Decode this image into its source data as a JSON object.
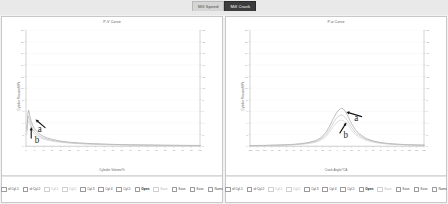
{
  "tabs": [
    {
      "label": "Mill Speed",
      "active": false
    },
    {
      "label": "Mill Crank",
      "active": true
    }
  ],
  "panels": [
    {
      "id": "pv-panel",
      "title": "P-V Curve",
      "xlabel": "Cylinder Volume/%",
      "ylabel": "Cylinder Pressure/MPa",
      "legend": [
        {
          "label": "of Cyl.1",
          "state": "plain",
          "color": "#9a9a9a"
        },
        {
          "label": "of Cyl.2",
          "state": "plain",
          "color": "#9a9a9a"
        },
        {
          "label": "Cyl.1",
          "state": "dim",
          "color": "#c9c9c9"
        },
        {
          "label": "Cyl.2",
          "state": "dim",
          "color": "#c9c9c9"
        },
        {
          "label": "Cyl.3",
          "state": "check",
          "color": "#8c8c8c"
        },
        {
          "label": "Cyl.4",
          "state": "check",
          "color": "#8c8c8c"
        },
        {
          "label": "Cyl.5",
          "state": "check",
          "color": "#8c8c8c"
        },
        {
          "label": "Open",
          "state": "bold",
          "color": "#555555"
        },
        {
          "label": "Save",
          "state": "dim",
          "color": "#c9c9c9"
        },
        {
          "label": "Save",
          "state": "check",
          "color": "#8c8c8c"
        },
        {
          "label": "Save",
          "state": "check",
          "color": "#8c8c8c"
        },
        {
          "label": "Name",
          "state": "check",
          "color": "#8c8c8c"
        }
      ]
    },
    {
      "id": "ptheta-panel",
      "title": "P-α Curve",
      "xlabel": "Crank Angle/°CA",
      "ylabel": "Cylinder Pressure/MPa",
      "legend": [
        {
          "label": "of Cyl.1",
          "state": "plain",
          "color": "#9a9a9a"
        },
        {
          "label": "of Cyl.2",
          "state": "plain",
          "color": "#9a9a9a"
        },
        {
          "label": "Cyl.1",
          "state": "dim",
          "color": "#c9c9c9"
        },
        {
          "label": "Cyl.2",
          "state": "dim",
          "color": "#c9c9c9"
        },
        {
          "label": "Cyl.3",
          "state": "check",
          "color": "#8c8c8c"
        },
        {
          "label": "Cyl.4",
          "state": "check",
          "color": "#8c8c8c"
        },
        {
          "label": "Cyl.5",
          "state": "check",
          "color": "#8c8c8c"
        },
        {
          "label": "Open",
          "state": "bold",
          "color": "#555555"
        },
        {
          "label": "Save",
          "state": "dim",
          "color": "#c9c9c9"
        },
        {
          "label": "Save",
          "state": "check",
          "color": "#8c8c8c"
        },
        {
          "label": "Save",
          "state": "check",
          "color": "#8c8c8c"
        },
        {
          "label": "Name",
          "state": "check",
          "color": "#8c8c8c"
        }
      ]
    }
  ],
  "chart_data": [
    {
      "type": "line",
      "id": "pv-curve",
      "title": "P-V Curve",
      "xlabel": "Cylinder Volume/%",
      "ylabel": "Cylinder Pressure/MPa",
      "xlim": [
        0,
        100
      ],
      "ylim": [
        0,
        20
      ],
      "xticks": [
        0,
        5,
        10,
        15,
        20,
        25,
        30,
        35,
        40,
        45,
        50,
        55,
        60,
        65,
        70,
        75,
        80,
        85,
        90,
        95,
        100
      ],
      "yticks": [
        0,
        2,
        4,
        6,
        8,
        10,
        12,
        14,
        16,
        18,
        20
      ],
      "right_axis": {
        "ylim": [
          0,
          20
        ],
        "yticks": [
          0,
          2,
          4,
          6,
          8,
          10,
          12,
          14,
          16,
          18,
          20
        ]
      },
      "grid": true,
      "legend_position": "bottom",
      "annotations": [
        {
          "text": "a",
          "x": 11,
          "y": 3.2,
          "arrow_to_x": 5.5,
          "arrow_to_y": 4.6
        },
        {
          "text": "b",
          "x": 3.0,
          "y": 1.4,
          "arrow_to_x": 3.0,
          "arrow_to_y": 3.3
        }
      ],
      "series": [
        {
          "name": "Cyl.3",
          "color": "#8c8c8c",
          "x": [
            0.5,
            1,
            1.5,
            2,
            2.5,
            3,
            4,
            5,
            6,
            8,
            10,
            12,
            15,
            20,
            25,
            30,
            35,
            40,
            50,
            60,
            70,
            80,
            90,
            100
          ],
          "y": [
            3.0,
            5.4,
            6.2,
            5.6,
            4.9,
            4.3,
            3.5,
            3.0,
            2.6,
            2.05,
            1.7,
            1.45,
            1.18,
            0.88,
            0.7,
            0.58,
            0.49,
            0.42,
            0.32,
            0.25,
            0.21,
            0.17,
            0.15,
            0.13
          ]
        },
        {
          "name": "Cyl.4",
          "color": "#b0b0b0",
          "x": [
            0.5,
            1,
            1.5,
            2,
            2.5,
            3,
            4,
            5,
            6,
            8,
            10,
            12,
            15,
            20,
            25,
            30,
            35,
            40,
            50,
            60,
            70,
            80,
            90,
            100
          ],
          "y": [
            2.6,
            4.6,
            5.2,
            4.7,
            4.1,
            3.6,
            2.9,
            2.5,
            2.15,
            1.7,
            1.42,
            1.22,
            1.0,
            0.75,
            0.6,
            0.5,
            0.42,
            0.36,
            0.28,
            0.22,
            0.18,
            0.15,
            0.13,
            0.11
          ]
        },
        {
          "name": "Cyl.5",
          "color": "#c8c8c8",
          "x": [
            0.5,
            1,
            1.5,
            2,
            2.5,
            3,
            4,
            5,
            6,
            8,
            10,
            12,
            15,
            20,
            25,
            30,
            35,
            40,
            50,
            60,
            70,
            80,
            90,
            100
          ],
          "y": [
            2.2,
            3.9,
            4.4,
            4.0,
            3.5,
            3.1,
            2.5,
            2.15,
            1.85,
            1.48,
            1.24,
            1.06,
            0.87,
            0.66,
            0.53,
            0.44,
            0.37,
            0.32,
            0.25,
            0.2,
            0.16,
            0.14,
            0.12,
            0.1
          ]
        }
      ]
    },
    {
      "type": "line",
      "id": "p-alpha-curve",
      "title": "P-α Curve",
      "xlabel": "Crank Angle/°CA",
      "ylabel": "Cylinder Pressure/MPa",
      "xlim": [
        -120,
        120
      ],
      "ylim": [
        0,
        20
      ],
      "xticks": [
        -120,
        -110,
        -100,
        -90,
        -80,
        -70,
        -60,
        -50,
        -40,
        -30,
        -20,
        -10,
        0,
        10,
        20,
        30,
        40,
        50,
        60,
        70,
        80,
        90,
        100,
        110,
        120
      ],
      "yticks": [
        0,
        2,
        4,
        6,
        8,
        10,
        12,
        14,
        16,
        18,
        20
      ],
      "right_axis": {
        "ylim": [
          0,
          20
        ],
        "yticks": [
          0,
          2,
          4,
          6,
          8,
          10,
          12,
          14,
          16,
          18,
          20
        ]
      },
      "grid": true,
      "legend_position": "bottom",
      "annotations": [
        {
          "text": "a",
          "x": 34,
          "y": 5.1,
          "arrow_to_x": 13,
          "arrow_to_y": 5.9
        },
        {
          "text": "b",
          "x": 4,
          "y": 2.3,
          "arrow_to_x": 13,
          "arrow_to_y": 4.1
        }
      ],
      "series": [
        {
          "name": "Cyl.3",
          "color": "#8c8c8c",
          "x": [
            -120,
            -100,
            -90,
            -80,
            -70,
            -60,
            -50,
            -40,
            -30,
            -25,
            -20,
            -15,
            -10,
            -5,
            0,
            3,
            6,
            9,
            12,
            15,
            20,
            25,
            30,
            40,
            50,
            60,
            70,
            80,
            90,
            100,
            110,
            120
          ],
          "y": [
            0.12,
            0.15,
            0.18,
            0.21,
            0.26,
            0.33,
            0.44,
            0.62,
            0.95,
            1.25,
            1.7,
            2.45,
            3.5,
            4.8,
            5.9,
            6.3,
            6.55,
            6.4,
            5.9,
            5.2,
            3.9,
            2.9,
            2.2,
            1.35,
            0.9,
            0.64,
            0.48,
            0.38,
            0.31,
            0.26,
            0.22,
            0.19
          ]
        },
        {
          "name": "Cyl.4",
          "color": "#b0b0b0",
          "x": [
            -120,
            -100,
            -90,
            -80,
            -70,
            -60,
            -50,
            -40,
            -30,
            -25,
            -20,
            -15,
            -10,
            -5,
            0,
            3,
            6,
            9,
            12,
            15,
            20,
            25,
            30,
            40,
            50,
            60,
            70,
            80,
            90,
            100,
            110,
            120
          ],
          "y": [
            0.1,
            0.13,
            0.15,
            0.18,
            0.22,
            0.28,
            0.38,
            0.53,
            0.8,
            1.05,
            1.42,
            2.05,
            2.95,
            4.05,
            4.95,
            5.25,
            5.4,
            5.25,
            4.85,
            4.3,
            3.25,
            2.45,
            1.9,
            1.18,
            0.8,
            0.57,
            0.43,
            0.34,
            0.28,
            0.23,
            0.2,
            0.17
          ]
        },
        {
          "name": "Cyl.5",
          "color": "#c8c8c8",
          "x": [
            -120,
            -100,
            -90,
            -80,
            -70,
            -60,
            -50,
            -40,
            -30,
            -25,
            -20,
            -15,
            -10,
            -5,
            0,
            3,
            6,
            9,
            12,
            15,
            20,
            25,
            30,
            40,
            50,
            60,
            70,
            80,
            90,
            100,
            110,
            120
          ],
          "y": [
            0.09,
            0.11,
            0.13,
            0.16,
            0.19,
            0.24,
            0.32,
            0.45,
            0.68,
            0.89,
            1.2,
            1.72,
            2.48,
            3.4,
            4.15,
            4.4,
            4.52,
            4.4,
            4.08,
            3.62,
            2.75,
            2.08,
            1.62,
            1.02,
            0.7,
            0.5,
            0.38,
            0.3,
            0.25,
            0.21,
            0.18,
            0.15
          ]
        }
      ]
    }
  ]
}
